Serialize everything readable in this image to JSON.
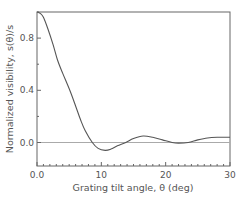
{
  "chart_data": {
    "type": "line",
    "title": "",
    "xlabel": "Grating tilt angle, θ (deg)",
    "ylabel": "Normalized visibility,  s(θ)/s",
    "xlim": [
      0,
      30
    ],
    "ylim": [
      -0.18,
      1.0
    ],
    "x_ticks": [
      0,
      10,
      20,
      30
    ],
    "x_tick_labels": [
      "0.0",
      "10",
      "20",
      "30"
    ],
    "x_minor_step": 1,
    "y_ticks": [
      0.0,
      0.4,
      0.8
    ],
    "y_tick_labels": [
      "0.0",
      "0.4",
      "0.8"
    ],
    "y_minor_step": 0.2,
    "grid": false,
    "legend": null,
    "reference_line": {
      "y": 0.0,
      "color": "#aaaaaa"
    },
    "series": [
      {
        "name": "normalized visibility",
        "color": "#555555",
        "x": [
          0,
          0.5,
          1,
          1.7,
          2.5,
          3.2,
          4,
          5.1,
          6,
          6.8,
          7.5,
          8.6,
          9.5,
          10.6,
          11.5,
          12.5,
          13.8,
          15,
          16.5,
          18,
          19.5,
          21,
          22,
          23.5,
          25,
          26.5,
          28,
          30
        ],
        "y": [
          1.0,
          0.99,
          0.96,
          0.87,
          0.75,
          0.63,
          0.53,
          0.4,
          0.28,
          0.17,
          0.09,
          0.0,
          -0.045,
          -0.06,
          -0.05,
          -0.025,
          0.0,
          0.03,
          0.05,
          0.04,
          0.02,
          0.0,
          -0.005,
          0.0,
          0.02,
          0.035,
          0.04,
          0.04
        ]
      }
    ]
  }
}
